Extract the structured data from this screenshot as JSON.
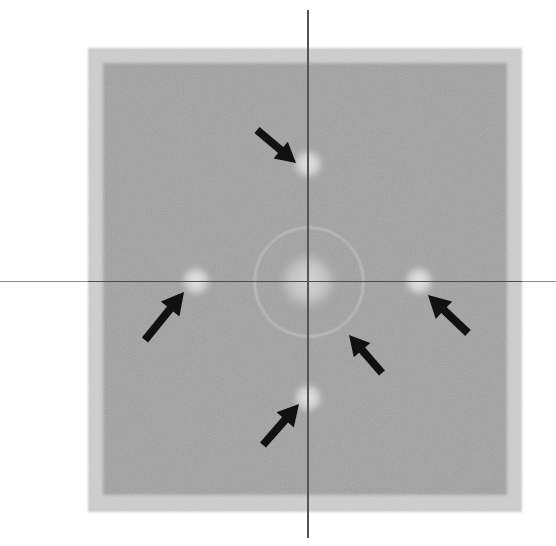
{
  "image": {
    "title": "Electron diffraction pattern with superlattice reflections",
    "width": 556,
    "height": 546,
    "background_color": "#ffffff",
    "modality": "grayscale micrograph / diffractogram"
  },
  "field": {
    "outer": {
      "label": "outer detector frame",
      "color": "#c9c9c9",
      "x": 88,
      "y": 48,
      "width": 434,
      "height": 464
    },
    "inner": {
      "label": "inner exposed field",
      "color": "#9e9e9e",
      "x": 103,
      "y": 63,
      "width": 404,
      "height": 432
    }
  },
  "axes": {
    "origin_label": "pattern centre",
    "center_x": 308,
    "center_y": 281,
    "horizontal": {
      "label": "horizontal reference line",
      "color": "#8d8d8d",
      "inside_color": "#4a4a4a",
      "y": 281,
      "x_start": 0,
      "x_end": 556
    },
    "vertical": {
      "label": "vertical reference line",
      "color": "#555555",
      "x": 308,
      "y_start": 10,
      "y_end": 538
    }
  },
  "ring": {
    "label": "first-order diffuse halo ring",
    "center_x": 308,
    "center_y": 281,
    "radius": 54,
    "color": "#e2e2e2"
  },
  "spots": [
    {
      "id": "spot-center",
      "label": "central transmitted beam",
      "cx": 308,
      "cy": 281,
      "r": 30,
      "color": "#d6d6d6",
      "order": "000"
    },
    {
      "id": "spot-top",
      "label": "superlattice reflection (top)",
      "cx": 308,
      "cy": 164,
      "r": 17,
      "color": "#e4e4e4",
      "order": "0 1"
    },
    {
      "id": "spot-left",
      "label": "superlattice reflection (left)",
      "cx": 196,
      "cy": 281,
      "r": 17,
      "color": "#e4e4e4",
      "order": "-1 0"
    },
    {
      "id": "spot-right",
      "label": "superlattice reflection (right)",
      "cx": 419,
      "cy": 281,
      "r": 17,
      "color": "#e4e4e4",
      "order": "1 0"
    },
    {
      "id": "spot-bottom",
      "label": "superlattice reflection (bottom)",
      "cx": 308,
      "cy": 398,
      "r": 17,
      "color": "#e4e4e4",
      "order": "0 -1"
    }
  ],
  "arrows": {
    "color": "#111111",
    "count": 5,
    "items": [
      {
        "id": "arrow-top",
        "label": "arrow marking top reflection",
        "tail_x": 257,
        "tail_y": 130,
        "tip_x": 296,
        "tip_y": 163,
        "shaft_width": 8,
        "head_length": 20,
        "head_width": 22
      },
      {
        "id": "arrow-left",
        "label": "arrow marking left reflection",
        "tail_x": 145,
        "tail_y": 340,
        "tip_x": 184,
        "tip_y": 292,
        "shaft_width": 8,
        "head_length": 22,
        "head_width": 24
      },
      {
        "id": "arrow-right",
        "label": "arrow marking right reflection",
        "tail_x": 468,
        "tail_y": 333,
        "tip_x": 428,
        "tip_y": 295,
        "shaft_width": 8,
        "head_length": 22,
        "head_width": 24
      },
      {
        "id": "arrow-bottom",
        "label": "arrow marking bottom reflection",
        "tail_x": 263,
        "tail_y": 445,
        "tip_x": 299,
        "tip_y": 404,
        "shaft_width": 8,
        "head_length": 21,
        "head_width": 23
      },
      {
        "id": "arrow-ring",
        "label": "arrow marking diffuse halo ring",
        "tail_x": 382,
        "tail_y": 373,
        "tip_x": 349,
        "tip_y": 335,
        "shaft_width": 8,
        "head_length": 20,
        "head_width": 22
      }
    ]
  }
}
